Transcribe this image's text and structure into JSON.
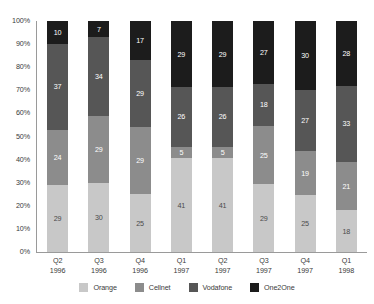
{
  "chart_data": {
    "type": "bar",
    "stacked": true,
    "stack_mode": "percent",
    "title": "",
    "subtitle": "",
    "xlabel": "",
    "ylabel": "",
    "ylim": [
      0,
      100
    ],
    "ytick_labels": [
      "100%",
      "90%",
      "80%",
      "70%",
      "60%",
      "50%",
      "40%",
      "30%",
      "20%",
      "10%",
      "0%"
    ],
    "ytick_values": [
      100,
      90,
      80,
      70,
      60,
      50,
      40,
      30,
      20,
      10,
      0
    ],
    "grid": false,
    "legend_position": "bottom",
    "categories": [
      "Q2 1996",
      "Q3 1996",
      "Q4 1996",
      "Q1 1997",
      "Q2 1997",
      "Q3 1997",
      "Q4 1997",
      "Q1 1998"
    ],
    "category_lines": [
      {
        "quarter": "Q2",
        "year": "1996"
      },
      {
        "quarter": "Q3",
        "year": "1996"
      },
      {
        "quarter": "Q4",
        "year": "1996"
      },
      {
        "quarter": "Q1",
        "year": "1997"
      },
      {
        "quarter": "Q2",
        "year": "1997"
      },
      {
        "quarter": "Q3",
        "year": "1997"
      },
      {
        "quarter": "Q4",
        "year": "1997"
      },
      {
        "quarter": "Q1",
        "year": "1998"
      }
    ],
    "series": [
      {
        "name": "Orange",
        "color": "#c8c8c8",
        "values": [
          29,
          30,
          25,
          41,
          41,
          29,
          25,
          18
        ]
      },
      {
        "name": "Cellnet",
        "color": "#8c8c8c",
        "values": [
          24,
          29,
          29,
          5,
          5,
          25,
          19,
          21
        ]
      },
      {
        "name": "Vodafone",
        "color": "#565656",
        "values": [
          37,
          34,
          29,
          26,
          26,
          18,
          27,
          33
        ]
      },
      {
        "name": "One2One",
        "color": "#1c1c1c",
        "values": [
          10,
          7,
          17,
          29,
          29,
          27,
          30,
          28
        ]
      }
    ]
  },
  "legend": {
    "items": [
      {
        "label": "Orange",
        "color": "#c8c8c8"
      },
      {
        "label": "Cellnet",
        "color": "#8c8c8c"
      },
      {
        "label": "Vodafone",
        "color": "#565656"
      },
      {
        "label": "One2One",
        "color": "#1c1c1c"
      }
    ]
  },
  "colors": {
    "axis": "#9a9a9a",
    "text": "#3a3a3a",
    "background": "#ffffff",
    "label_on_dark": "#ffffff",
    "label_on_light": "#4a4a4a"
  }
}
